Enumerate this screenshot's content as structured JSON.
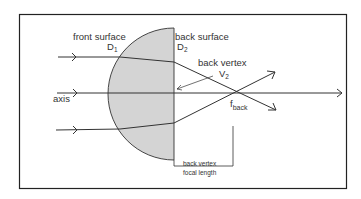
{
  "diagram": {
    "labels": {
      "front_surface": "front surface",
      "front_surface_symbol": "D",
      "front_surface_sub": "1",
      "back_surface": "back surface",
      "back_surface_symbol": "D",
      "back_surface_sub": "2",
      "back_vertex": "back vertex",
      "back_vertex_symbol": "V",
      "back_vertex_sub": "2",
      "axis": "axis",
      "focal_symbol": "f",
      "focal_sub": "back",
      "bvfl_line1": "back vertex",
      "bvfl_line2": "focal length"
    },
    "colors": {
      "lens_fill": "#d4d4d4",
      "line": "#333333",
      "frame": "#222222"
    }
  }
}
